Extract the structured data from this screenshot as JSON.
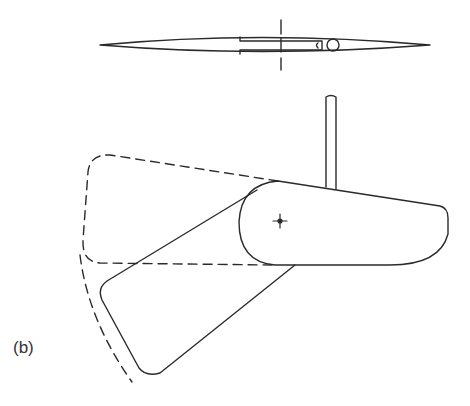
{
  "figure": {
    "label": "(b)",
    "views": [
      {
        "name": "top-view",
        "description": "blade plan view with slot and pin hole, dashed axis line"
      },
      {
        "name": "side-view",
        "description": "pivoting blade with shaft, rotated position and dashed outline"
      }
    ],
    "colors": {
      "stroke": "#2a2a2a",
      "background": "#ffffff"
    }
  }
}
